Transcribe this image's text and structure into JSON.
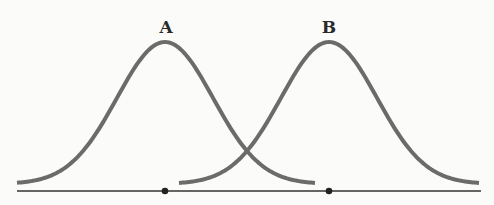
{
  "diagram": {
    "title": "",
    "curves": [
      {
        "label": "A",
        "mean_x": 165,
        "start_x": 17,
        "end_x": 316
      },
      {
        "label": "B",
        "mean_x": 329,
        "start_x": 179,
        "end_x": 480
      }
    ],
    "axis": {
      "start_x": 17,
      "end_x": 481,
      "y": 191
    },
    "markers": [
      {
        "x": 165,
        "for": "A"
      },
      {
        "x": 329,
        "for": "B"
      }
    ],
    "colors": {
      "curve": "#6b6b6b",
      "axis": "#333333",
      "marker": "#222222",
      "label": "#2a2a2a",
      "background": "#fbfbfa"
    }
  }
}
